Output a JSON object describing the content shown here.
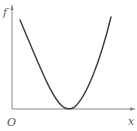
{
  "diagram": {
    "type": "function-graph",
    "labels": {
      "y_axis": "f",
      "x_axis": "x",
      "origin": "O"
    },
    "colors": {
      "axis": "#8a8a8a",
      "curve": "#3a3a3a",
      "label": "#555555",
      "background": "#ffffff"
    },
    "curve": {
      "shape": "parabola-like",
      "start_point_px": [
        20,
        20
      ],
      "minimum_point_px": [
        69,
        109
      ],
      "end_point_px": [
        111,
        17
      ],
      "touches_x_axis": true
    }
  }
}
